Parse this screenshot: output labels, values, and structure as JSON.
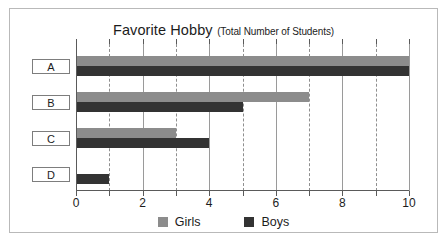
{
  "chart_data": {
    "type": "bar",
    "orientation": "horizontal",
    "title": "Favorite Hobby",
    "subtitle": "(Total Number of Students)",
    "xlabel": "",
    "ylabel": "",
    "categories": [
      "A",
      "B",
      "C",
      "D"
    ],
    "series": [
      {
        "name": "Girls",
        "color": "#8c8c8c",
        "values": [
          10,
          7,
          3,
          0
        ]
      },
      {
        "name": "Boys",
        "color": "#333333",
        "values": [
          10,
          5,
          4,
          1
        ]
      }
    ],
    "xlim": [
      0,
      10
    ],
    "x_tick_labels": [
      "0",
      "2",
      "4",
      "6",
      "8",
      "10"
    ],
    "x_tick_values": [
      0,
      2,
      4,
      6,
      8,
      10
    ],
    "x_minor_tick_values": [
      1,
      3,
      5,
      7,
      9
    ],
    "grid": {
      "major_solid": true,
      "minor_dashed": true
    },
    "legend": {
      "position": "bottom",
      "entries": [
        {
          "label": "Girls",
          "color": "#8c8c8c"
        },
        {
          "label": "Boys",
          "color": "#333333"
        }
      ]
    }
  },
  "colors": {
    "girls": "#8c8c8c",
    "boys": "#333333",
    "axis": "#5a5a5a",
    "grid_major": "#9a9a9a",
    "grid_minor": "#8f8f8f",
    "frame_border": "#b9b9b9",
    "text": "#1c1c1c"
  }
}
